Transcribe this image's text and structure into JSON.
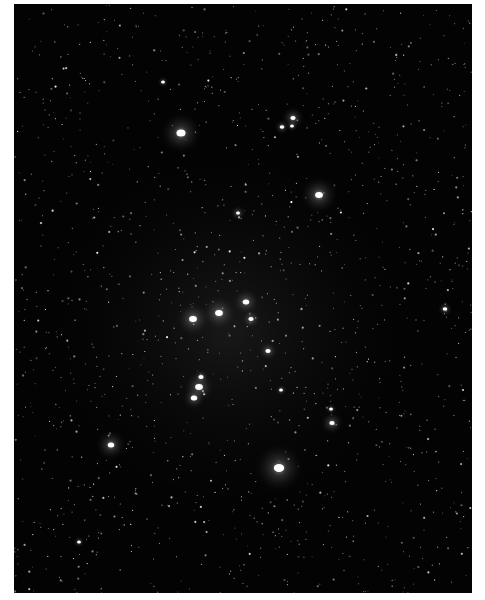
{
  "image": {
    "subject": "star-cluster",
    "background_color": "#030303",
    "border_color": "#ffffff",
    "field": {
      "x": 14,
      "y": 4,
      "width": 458,
      "height": 589
    }
  },
  "bright_stars": [
    {
      "x": 181,
      "y": 133,
      "r": 3.5,
      "glow": 22
    },
    {
      "x": 319,
      "y": 195,
      "r": 3,
      "glow": 20
    },
    {
      "x": 193,
      "y": 319,
      "r": 3,
      "glow": 18
    },
    {
      "x": 219,
      "y": 313,
      "r": 3,
      "glow": 18
    },
    {
      "x": 246,
      "y": 302,
      "r": 2.5,
      "glow": 14
    },
    {
      "x": 251,
      "y": 319,
      "r": 2,
      "glow": 10
    },
    {
      "x": 268,
      "y": 351,
      "r": 2,
      "glow": 10
    },
    {
      "x": 199,
      "y": 387,
      "r": 3,
      "glow": 16
    },
    {
      "x": 194,
      "y": 398,
      "r": 2.5,
      "glow": 12
    },
    {
      "x": 201,
      "y": 377,
      "r": 2,
      "glow": 8
    },
    {
      "x": 279,
      "y": 468,
      "r": 4,
      "glow": 26
    },
    {
      "x": 111,
      "y": 445,
      "r": 2.5,
      "glow": 16
    },
    {
      "x": 293,
      "y": 118,
      "r": 2,
      "glow": 12
    },
    {
      "x": 282,
      "y": 127,
      "r": 1.8,
      "glow": 8
    },
    {
      "x": 292,
      "y": 126,
      "r": 1.5,
      "glow": 6
    },
    {
      "x": 332,
      "y": 423,
      "r": 2,
      "glow": 12
    },
    {
      "x": 331,
      "y": 409,
      "r": 1.5,
      "glow": 6
    },
    {
      "x": 445,
      "y": 309,
      "r": 1.8,
      "glow": 8
    },
    {
      "x": 238,
      "y": 213,
      "r": 1.5,
      "glow": 8
    },
    {
      "x": 281,
      "y": 390,
      "r": 1.5,
      "glow": 6
    },
    {
      "x": 163,
      "y": 82,
      "r": 1.5,
      "glow": 6
    },
    {
      "x": 79,
      "y": 542,
      "r": 1.5,
      "glow": 6
    }
  ],
  "faint_star_count": 1400,
  "seed": 42
}
